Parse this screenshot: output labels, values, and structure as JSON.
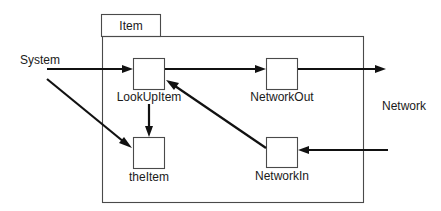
{
  "diagram": {
    "type": "component-dataflow",
    "container": {
      "id": "item",
      "label": "Item"
    },
    "external_labels": {
      "system": "System",
      "network": "Network"
    },
    "nodes": [
      {
        "id": "lookupitem",
        "label": "LookUpItem"
      },
      {
        "id": "networkout",
        "label": "NetworkOut"
      },
      {
        "id": "theitem",
        "label": "theItem"
      },
      {
        "id": "networkin",
        "label": "NetworkIn"
      }
    ],
    "edges": [
      {
        "from": "System",
        "to": "LookUpItem"
      },
      {
        "from": "System",
        "to": "theItem"
      },
      {
        "from": "LookUpItem",
        "to": "NetworkOut"
      },
      {
        "from": "LookUpItem",
        "to": "theItem"
      },
      {
        "from": "NetworkOut",
        "to": "Network"
      },
      {
        "from": "Network",
        "to": "NetworkIn"
      },
      {
        "from": "NetworkIn",
        "to": "LookUpItem"
      }
    ],
    "colors": {
      "stroke": "#4a4a4a",
      "arrow": "#111111",
      "text": "#1a1a1a",
      "background": "#ffffff"
    }
  }
}
